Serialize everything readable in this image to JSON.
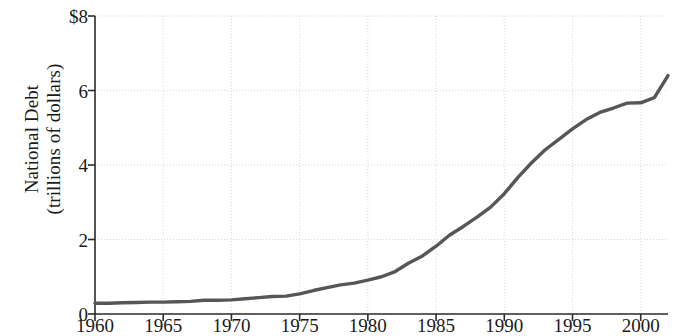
{
  "chart_data": {
    "type": "line",
    "title": "",
    "xlabel": "",
    "ylabel": "National Debt (trillions of dollars)",
    "ylabel_line1": "National Debt",
    "ylabel_line2": "(trillions of dollars)",
    "xlim": [
      1960,
      2002
    ],
    "ylim": [
      0,
      8
    ],
    "grid": true,
    "legend": "none",
    "y_ticks": [
      0,
      2,
      4,
      6,
      8
    ],
    "y_tick_labels": [
      "0",
      "2",
      "4",
      "6",
      "$8"
    ],
    "x_ticks": [
      1960,
      1965,
      1970,
      1975,
      1980,
      1985,
      1990,
      1995,
      2000
    ],
    "x_tick_labels": [
      "1960",
      "1965",
      "1970",
      "1975",
      "1980",
      "1985",
      "1990",
      "1995",
      "2000"
    ],
    "series": [
      {
        "name": "National Debt",
        "color": "#565656",
        "x": [
          1960,
          1961,
          1962,
          1963,
          1964,
          1965,
          1966,
          1967,
          1968,
          1969,
          1970,
          1971,
          1972,
          1973,
          1974,
          1975,
          1976,
          1977,
          1978,
          1979,
          1980,
          1981,
          1982,
          1983,
          1984,
          1985,
          1986,
          1987,
          1988,
          1989,
          1990,
          1991,
          1992,
          1993,
          1994,
          1995,
          1996,
          1997,
          1998,
          1999,
          2000,
          2001,
          2002
        ],
        "values": [
          0.29,
          0.29,
          0.3,
          0.31,
          0.32,
          0.32,
          0.33,
          0.34,
          0.37,
          0.37,
          0.38,
          0.41,
          0.44,
          0.47,
          0.48,
          0.54,
          0.63,
          0.71,
          0.78,
          0.83,
          0.91,
          1.0,
          1.14,
          1.37,
          1.56,
          1.82,
          2.12,
          2.35,
          2.6,
          2.87,
          3.23,
          3.67,
          4.06,
          4.41,
          4.69,
          4.97,
          5.22,
          5.41,
          5.53,
          5.66,
          5.67,
          5.81,
          6.4
        ]
      }
    ]
  },
  "axes": {
    "y_axis_name": "y-axis",
    "x_axis_name": "x-axis"
  }
}
